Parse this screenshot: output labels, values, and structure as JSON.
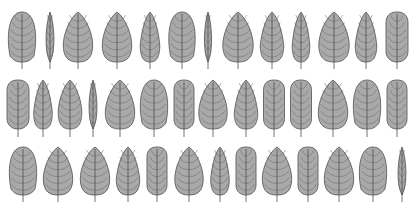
{
  "image": {
    "width": 417,
    "height": 205,
    "background": "#ffffff",
    "leaf_fill": "#a9a9a9",
    "leaf_stroke": "#5e5e5e"
  },
  "rows": [
    {
      "top": 12,
      "bottom": 62,
      "stem_end": 69,
      "leaves": [
        {
          "cx": 22,
          "w": 28,
          "shape": "oval"
        },
        {
          "cx": 50,
          "w": 10,
          "shape": "thin"
        },
        {
          "cx": 78,
          "w": 30,
          "shape": "egg"
        },
        {
          "cx": 117,
          "w": 30,
          "shape": "egg"
        },
        {
          "cx": 150,
          "w": 20,
          "shape": "narrow"
        },
        {
          "cx": 182,
          "w": 27,
          "shape": "oval"
        },
        {
          "cx": 208,
          "w": 9,
          "shape": "thin"
        },
        {
          "cx": 238,
          "w": 31,
          "shape": "egg"
        },
        {
          "cx": 272,
          "w": 24,
          "shape": "narrow"
        },
        {
          "cx": 301,
          "w": 18,
          "shape": "narrow"
        },
        {
          "cx": 334,
          "w": 31,
          "shape": "egg"
        },
        {
          "cx": 366,
          "w": 22,
          "shape": "narrow"
        },
        {
          "cx": 397,
          "w": 22,
          "shape": "capsule"
        }
      ]
    },
    {
      "top": 80,
      "bottom": 129,
      "stem_end": 137,
      "leaves": [
        {
          "cx": 18,
          "w": 22,
          "shape": "capsule"
        },
        {
          "cx": 43,
          "w": 19,
          "shape": "narrow"
        },
        {
          "cx": 70,
          "w": 24,
          "shape": "egg"
        },
        {
          "cx": 93,
          "w": 10,
          "shape": "thin"
        },
        {
          "cx": 120,
          "w": 30,
          "shape": "egg"
        },
        {
          "cx": 154,
          "w": 28,
          "shape": "oval"
        },
        {
          "cx": 184,
          "w": 20,
          "shape": "capsule"
        },
        {
          "cx": 213,
          "w": 29,
          "shape": "egg"
        },
        {
          "cx": 246,
          "w": 24,
          "shape": "narrow"
        },
        {
          "cx": 274,
          "w": 21,
          "shape": "capsule"
        },
        {
          "cx": 301,
          "w": 21,
          "shape": "capsule"
        },
        {
          "cx": 333,
          "w": 30,
          "shape": "egg"
        },
        {
          "cx": 367,
          "w": 28,
          "shape": "oval"
        },
        {
          "cx": 397,
          "w": 20,
          "shape": "capsule"
        }
      ]
    },
    {
      "top": 147,
      "bottom": 195,
      "stem_end": 202,
      "leaves": [
        {
          "cx": 23,
          "w": 28,
          "shape": "oval"
        },
        {
          "cx": 58,
          "w": 30,
          "shape": "egg"
        },
        {
          "cx": 95,
          "w": 30,
          "shape": "egg"
        },
        {
          "cx": 128,
          "w": 24,
          "shape": "narrow"
        },
        {
          "cx": 157,
          "w": 20,
          "shape": "capsule"
        },
        {
          "cx": 189,
          "w": 29,
          "shape": "egg"
        },
        {
          "cx": 220,
          "w": 19,
          "shape": "narrow"
        },
        {
          "cx": 246,
          "w": 20,
          "shape": "capsule"
        },
        {
          "cx": 277,
          "w": 30,
          "shape": "egg"
        },
        {
          "cx": 308,
          "w": 20,
          "shape": "capsule"
        },
        {
          "cx": 339,
          "w": 30,
          "shape": "egg"
        },
        {
          "cx": 373,
          "w": 28,
          "shape": "oval"
        },
        {
          "cx": 402,
          "w": 10,
          "shape": "thin"
        }
      ]
    }
  ]
}
